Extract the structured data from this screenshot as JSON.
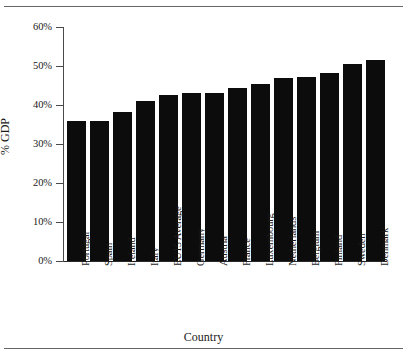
{
  "chart_data": {
    "type": "bar",
    "title": "",
    "xlabel": "Country",
    "ylabel": "% GDP",
    "categories": [
      "Portugal",
      "Spain",
      "Ireland",
      "Italy",
      "EU15 Average",
      "Germany",
      "Austria",
      "France",
      "Luxembourg",
      "Netherlands",
      "Belgium",
      "Finland",
      "Sweden",
      "Denmark"
    ],
    "values": [
      36.0,
      36.0,
      38.2,
      41.0,
      42.5,
      43.0,
      43.0,
      44.3,
      45.5,
      46.8,
      47.2,
      48.2,
      50.5,
      51.5
    ],
    "ylim": [
      0,
      60
    ],
    "ytick_values": [
      0,
      10,
      20,
      30,
      40,
      50,
      60
    ],
    "ytick_labels": [
      "0%",
      "10%",
      "20%",
      "30%",
      "40%",
      "50%",
      "60%"
    ],
    "grid": false,
    "legend": null,
    "bar_color": "#0c0c0c",
    "axis_color": "#2a2a2a",
    "background": "#ffffff"
  }
}
